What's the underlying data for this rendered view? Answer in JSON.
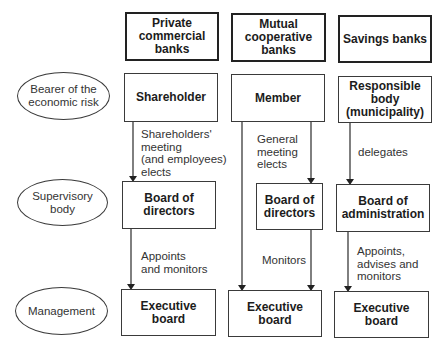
{
  "columns": {
    "private": {
      "header": "Private\ncommercial\nbanks",
      "risk": "Shareholder",
      "supervisory": "Board of\ndirectors",
      "management": "Executive\nboard",
      "edge1": "Shareholders'\nmeeting\n(and employees)\nelects",
      "edge2": "Appoints\nand monitors"
    },
    "mutual": {
      "header": "Mutual\ncooperative\nbanks",
      "risk": "Member",
      "supervisory": "Board of\ndirectors",
      "management": "Executive\nboard",
      "edge1": "General\nmeeting\nelects",
      "edge2": "Monitors"
    },
    "savings": {
      "header": "Savings banks",
      "risk": "Responsible\nbody\n(municipality)",
      "supervisory": "Board of\nadministration",
      "management": "Executive\nboard",
      "edge1": "delegates",
      "edge2": "Appoints,\nadvises and\nmonitors"
    }
  },
  "rows": {
    "risk": "Bearer of the\neconomic risk",
    "supervisory": "Supervisory\nbody",
    "management": "Management"
  },
  "colors": {
    "line": "#2a2a2a",
    "text": "#1c1c1c"
  }
}
